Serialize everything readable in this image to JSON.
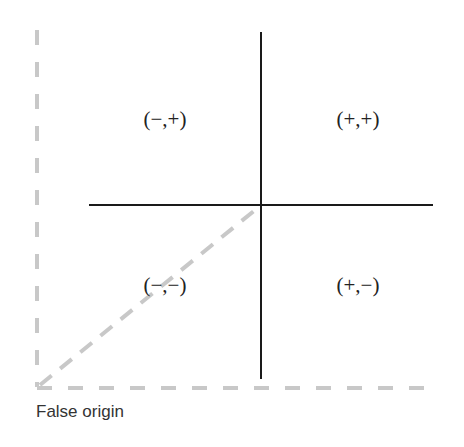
{
  "diagram": {
    "type": "quadrant-axes",
    "quadrants": {
      "top_left": "(−,+)",
      "top_right": "(+,+)",
      "bottom_left": "(−,−)",
      "bottom_right": "(+,−)"
    },
    "caption": "False origin",
    "colors": {
      "axis": "#1a1a1a",
      "dashed": "#c8c8c8",
      "text": "#222222"
    }
  }
}
